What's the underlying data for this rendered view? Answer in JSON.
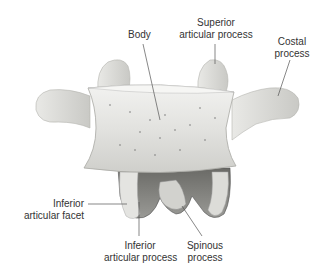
{
  "figure": {
    "labels": {
      "body": "Body",
      "superior_articular_process_1": "Superior",
      "superior_articular_process_2": "articular process",
      "costal_process_1": "Costal",
      "costal_process_2": "process",
      "inferior_articular_facet_1": "Inferior",
      "inferior_articular_facet_2": "articular facet",
      "inferior_articular_process_1": "Inferior",
      "inferior_articular_process_2": "articular process",
      "spinous_process_1": "Spinous",
      "spinous_process_2": "process"
    }
  }
}
